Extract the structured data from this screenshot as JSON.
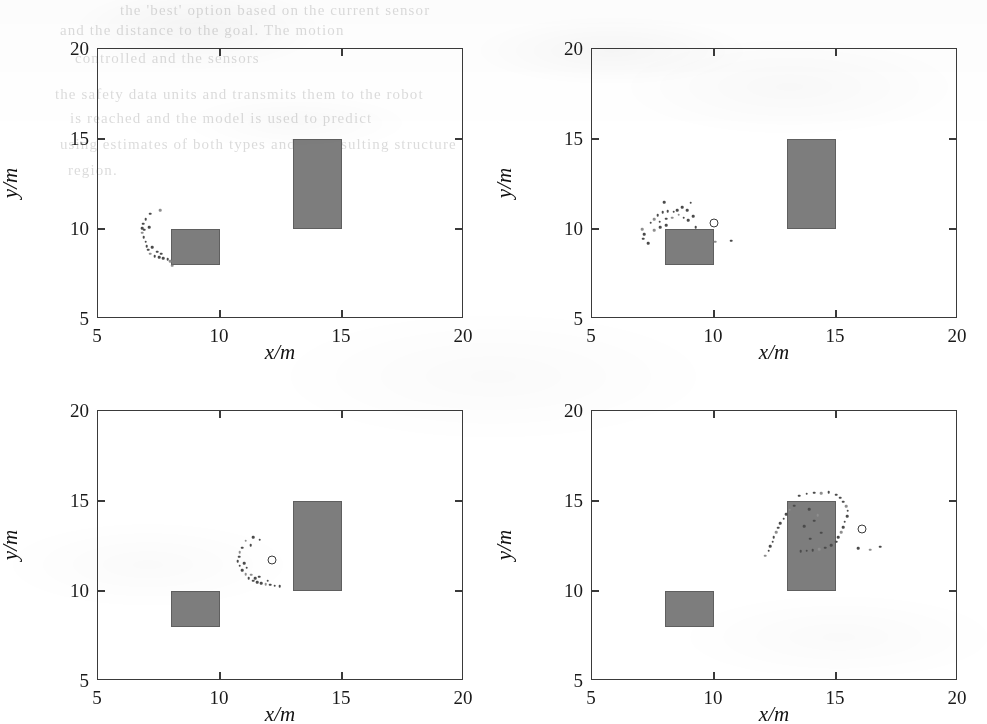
{
  "figure": {
    "kind": "scatter-panel-grid",
    "rows": 2,
    "columns": 2,
    "obstacle_color": "#7d7d7d",
    "dot_color": "#4b4b4b",
    "axis_color": "#3a3a3a",
    "background_color": "#ffffff"
  },
  "bleed_through_text": [
    {
      "text": "the 'best' option based on the current sensor",
      "x": 120,
      "y": 2
    },
    {
      "text": "and the distance to the goal. The motion",
      "x": 60,
      "y": 22
    },
    {
      "text": "controlled and the sensors",
      "x": 75,
      "y": 50
    },
    {
      "text": "the safety data units and transmits them to the robot",
      "x": 55,
      "y": 86
    },
    {
      "text": "is reached and the model is used to predict",
      "x": 70,
      "y": 110
    },
    {
      "text": "using estimates of both types and the resulting structure",
      "x": 60,
      "y": 136
    },
    {
      "text": "region.",
      "x": 68,
      "y": 162
    }
  ],
  "axes": {
    "xlabel": "x/m",
    "ylabel": "y/m",
    "xticks": [
      5,
      10,
      15,
      20
    ],
    "yticks": [
      5,
      10,
      15,
      20
    ],
    "xtick_labels": [
      "5",
      "10",
      "15",
      "20"
    ],
    "ytick_labels": [
      "5",
      "10",
      "15",
      "20"
    ],
    "xlim": [
      5,
      20
    ],
    "ylim": [
      5,
      20
    ],
    "grid": false
  },
  "chart_data": {
    "type": "scatter",
    "title": "",
    "xlabel": "x/m",
    "ylabel": "y/m",
    "xlim": [
      5,
      20
    ],
    "ylim": [
      5,
      20
    ],
    "grid": false,
    "legend": "none",
    "panel_count": 4,
    "shared_obstacles": [
      {
        "name": "obstacle-small",
        "x": 8,
        "y": 8,
        "width": 2,
        "height": 2
      },
      {
        "name": "obstacle-large",
        "x": 13,
        "y": 10,
        "width": 2,
        "height": 5
      }
    ],
    "panels": [
      {
        "name": "panel-top-left",
        "index": 0,
        "obstacles": [
          {
            "x": 8,
            "y": 8,
            "width": 2,
            "height": 2
          },
          {
            "x": 13,
            "y": 10,
            "width": 2,
            "height": 5
          }
        ],
        "goal_marker": null,
        "points": [
          [
            7.55,
            11.05
          ],
          [
            7.15,
            10.85
          ],
          [
            6.95,
            10.55
          ],
          [
            6.85,
            10.3
          ],
          [
            6.8,
            10.05
          ],
          [
            6.8,
            9.8
          ],
          [
            6.88,
            9.55
          ],
          [
            6.95,
            9.3
          ],
          [
            7.0,
            9.05
          ],
          [
            7.05,
            8.85
          ],
          [
            7.15,
            8.62
          ],
          [
            7.32,
            8.5
          ],
          [
            7.5,
            8.42
          ],
          [
            7.68,
            8.38
          ],
          [
            7.85,
            8.33
          ],
          [
            7.95,
            8.2
          ],
          [
            7.42,
            8.75
          ],
          [
            7.6,
            8.62
          ],
          [
            7.22,
            9.0
          ],
          [
            6.9,
            9.95
          ],
          [
            8.05,
            7.95
          ],
          [
            7.1,
            10.1
          ]
        ]
      },
      {
        "name": "panel-top-right",
        "index": 1,
        "obstacles": [
          {
            "x": 8,
            "y": 8,
            "width": 2,
            "height": 2
          },
          {
            "x": 13,
            "y": 10,
            "width": 2,
            "height": 5
          }
        ],
        "goal_marker": {
          "x": 10.0,
          "y": 10.35
        },
        "points": [
          [
            7.05,
            10.0
          ],
          [
            7.15,
            9.7
          ],
          [
            7.1,
            9.45
          ],
          [
            7.3,
            9.2
          ],
          [
            7.4,
            10.35
          ],
          [
            7.55,
            10.55
          ],
          [
            7.7,
            10.78
          ],
          [
            7.9,
            10.92
          ],
          [
            8.1,
            11.0
          ],
          [
            8.35,
            10.95
          ],
          [
            8.55,
            10.8
          ],
          [
            8.75,
            10.62
          ],
          [
            8.95,
            10.5
          ],
          [
            7.78,
            10.4
          ],
          [
            8.05,
            10.58
          ],
          [
            8.28,
            10.62
          ],
          [
            8.5,
            11.05
          ],
          [
            8.7,
            11.22
          ],
          [
            8.9,
            11.05
          ],
          [
            9.15,
            10.7
          ],
          [
            7.55,
            9.92
          ],
          [
            7.8,
            10.1
          ],
          [
            8.05,
            10.2
          ],
          [
            9.05,
            11.45
          ],
          [
            7.95,
            11.48
          ],
          [
            10.05,
            9.3
          ],
          [
            10.7,
            9.35
          ],
          [
            9.25,
            10.1
          ]
        ]
      },
      {
        "name": "panel-bottom-left",
        "index": 2,
        "obstacles": [
          {
            "x": 8,
            "y": 8,
            "width": 2,
            "height": 2
          },
          {
            "x": 13,
            "y": 10,
            "width": 2,
            "height": 5
          }
        ],
        "goal_marker": {
          "x": 12.15,
          "y": 11.7
        },
        "points": [
          [
            11.05,
            12.8
          ],
          [
            11.35,
            13.0
          ],
          [
            11.62,
            12.85
          ],
          [
            11.25,
            12.55
          ],
          [
            10.9,
            12.4
          ],
          [
            10.8,
            12.15
          ],
          [
            10.78,
            11.9
          ],
          [
            10.72,
            11.65
          ],
          [
            10.8,
            11.4
          ],
          [
            10.92,
            11.15
          ],
          [
            11.05,
            10.92
          ],
          [
            11.18,
            10.72
          ],
          [
            11.35,
            10.58
          ],
          [
            11.52,
            10.48
          ],
          [
            11.7,
            10.42
          ],
          [
            11.88,
            10.38
          ],
          [
            12.05,
            10.35
          ],
          [
            12.25,
            10.3
          ],
          [
            11.45,
            10.72
          ],
          [
            11.6,
            10.8
          ],
          [
            11.28,
            10.9
          ],
          [
            10.98,
            11.55
          ],
          [
            11.1,
            11.3
          ],
          [
            12.45,
            10.28
          ],
          [
            11.95,
            10.58
          ]
        ]
      },
      {
        "name": "panel-bottom-right",
        "index": 3,
        "obstacles": [
          {
            "x": 8,
            "y": 8,
            "width": 2,
            "height": 2
          },
          {
            "x": 13,
            "y": 10,
            "width": 2,
            "height": 5
          }
        ],
        "goal_marker": {
          "x": 16.05,
          "y": 13.45
        },
        "points": [
          [
            12.1,
            11.95
          ],
          [
            12.25,
            12.25
          ],
          [
            12.3,
            12.5
          ],
          [
            12.4,
            12.75
          ],
          [
            12.45,
            13.0
          ],
          [
            12.55,
            13.28
          ],
          [
            12.62,
            13.52
          ],
          [
            12.72,
            13.78
          ],
          [
            12.85,
            14.02
          ],
          [
            12.95,
            14.28
          ],
          [
            13.1,
            14.52
          ],
          [
            13.28,
            14.75
          ],
          [
            13.5,
            15.3
          ],
          [
            13.8,
            15.4
          ],
          [
            14.1,
            15.45
          ],
          [
            14.4,
            15.42
          ],
          [
            14.7,
            15.48
          ],
          [
            15.0,
            15.35
          ],
          [
            15.18,
            15.18
          ],
          [
            15.3,
            14.95
          ],
          [
            15.42,
            14.7
          ],
          [
            15.48,
            14.45
          ],
          [
            15.45,
            14.15
          ],
          [
            15.35,
            13.85
          ],
          [
            15.3,
            13.55
          ],
          [
            15.22,
            13.28
          ],
          [
            15.1,
            13.0
          ],
          [
            15.0,
            12.75
          ],
          [
            14.8,
            12.55
          ],
          [
            14.55,
            12.4
          ],
          [
            14.3,
            12.32
          ],
          [
            14.05,
            12.28
          ],
          [
            13.8,
            12.25
          ],
          [
            13.55,
            12.22
          ],
          [
            13.9,
            14.55
          ],
          [
            14.25,
            14.2
          ],
          [
            13.7,
            13.6
          ],
          [
            14.4,
            13.25
          ],
          [
            13.95,
            12.9
          ],
          [
            14.1,
            13.9
          ],
          [
            16.4,
            12.3
          ],
          [
            15.9,
            12.38
          ],
          [
            16.8,
            12.45
          ]
        ]
      }
    ]
  }
}
